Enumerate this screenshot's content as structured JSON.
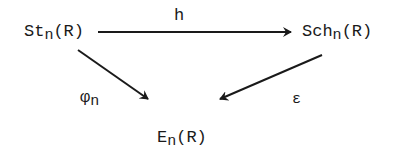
{
  "diagram": {
    "type": "commutative-triangle",
    "nodes": {
      "top_left": {
        "base": "St",
        "sub": "n",
        "arg": "(R)"
      },
      "top_right": {
        "base": "Sch",
        "sub": "n",
        "arg": "(R)"
      },
      "bottom": {
        "base": "E",
        "sub": "n",
        "arg": "(R)"
      }
    },
    "arrows": {
      "top": {
        "label": "h",
        "from": "St_n(R)",
        "to": "Sch_n(R)"
      },
      "left": {
        "label_base": "φ",
        "label_sub": "n",
        "from": "St_n(R)",
        "to": "E_n(R)"
      },
      "right": {
        "label": "ε",
        "from": "Sch_n(R)",
        "to": "E_n(R)"
      }
    },
    "colors": {
      "ink": "#1a1a1a",
      "background": "#ffffff"
    }
  }
}
